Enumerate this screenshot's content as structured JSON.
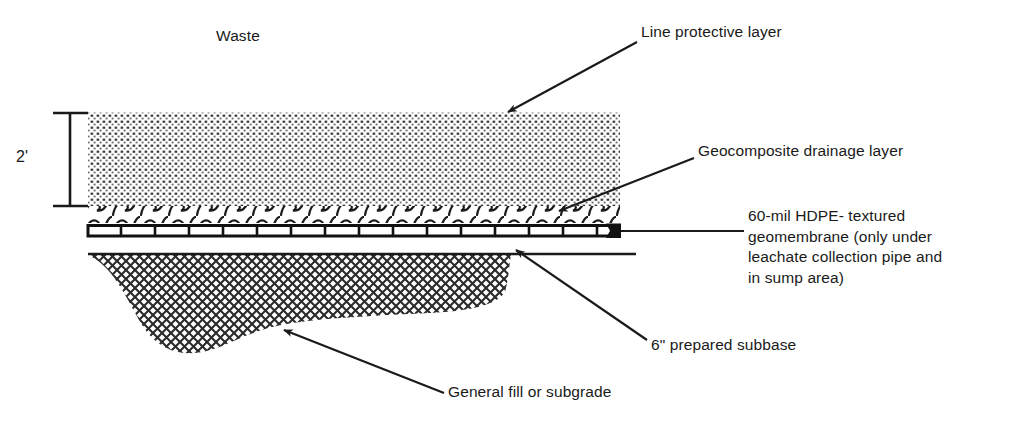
{
  "diagram": {
    "colors": {
      "ink": "#1a1a1a",
      "background": "#ffffff",
      "hatch": "#2b2b2b",
      "stipple": "#3a3a3a"
    },
    "dimension": {
      "value": "2'",
      "name": "waste-protective-layer-thickness"
    },
    "labels": {
      "waste": "Waste",
      "line_protective_layer": "Line protective layer",
      "geocomposite_drainage_layer": "Geocomposite drainage layer",
      "hdpe_geomembrane": "60-mil HDPE- textured\ngeomembrane (only under\nleachate collection pipe and\nin sump area)",
      "prepared_subbase": "6\" prepared subbase",
      "general_fill_or_subgrade": "General fill or subgrade"
    },
    "layers": [
      {
        "name": "line-protective-layer",
        "pattern": "stipple"
      },
      {
        "name": "geocomposite-drainage-layer",
        "pattern": "wave"
      },
      {
        "name": "hdpe-geomembrane",
        "pattern": "segmented-bar"
      },
      {
        "name": "prepared-subbase",
        "pattern": "line"
      },
      {
        "name": "general-fill-subgrade",
        "pattern": "cross-hatch"
      }
    ]
  }
}
